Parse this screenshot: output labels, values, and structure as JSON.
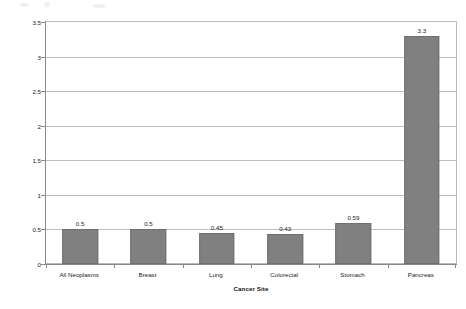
{
  "chart_data": {
    "type": "bar",
    "title": "",
    "xlabel": "Cancer Site",
    "ylabel": "Standardised Morality Ratio",
    "categories": [
      "All Neoplasms",
      "Breast",
      "Lung",
      "Colorectal",
      "Stomach",
      "Pancreas"
    ],
    "values": [
      0.5,
      0.5,
      0.45,
      0.43,
      0.59,
      3.3
    ],
    "value_labels": [
      "0.5",
      "0.5",
      "0.45",
      "0.43",
      "0.59",
      "3.3"
    ],
    "ylim": [
      0,
      3.5
    ],
    "yticks": [
      0,
      0.5,
      1,
      1.5,
      2,
      2.5,
      3,
      3.5
    ],
    "ytick_labels": [
      "0",
      "0.5",
      "1",
      "1.5",
      "2",
      "2.5",
      "3",
      "3.5"
    ],
    "grid": true,
    "grid_axis": "y",
    "legend": false,
    "legend_position": "none",
    "series": [
      {
        "name": "Standardised Morality Ratio",
        "color": "#808080",
        "values": [
          0.5,
          0.5,
          0.45,
          0.43,
          0.59,
          3.3
        ]
      }
    ]
  },
  "style": {
    "bar_color": "#808080",
    "bar_border_color": "#6f6f6f",
    "grid_color": "#bdbdbd",
    "axis_color": "#8a8a8a",
    "plot_border_color": "#b9b9b9",
    "background": "#ffffff",
    "text_color": "#1c1c1c"
  }
}
